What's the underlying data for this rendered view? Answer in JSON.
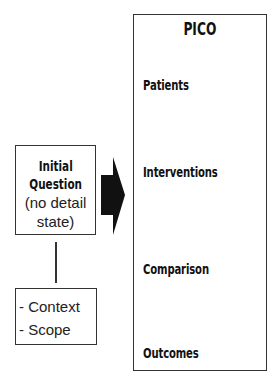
{
  "pico": {
    "title": "PICO",
    "items": [
      "Patients",
      "Interventions",
      "Comparison",
      "Outcomes"
    ]
  },
  "initial_question": {
    "title_line1": "Initial",
    "title_line2": "Question",
    "sub_line1": "(no detail",
    "sub_line2": "state)"
  },
  "scope_box": {
    "items": [
      "- Context",
      "- Scope"
    ]
  },
  "arrow": {
    "icon": "right-arrow-icon",
    "color": "#111111"
  }
}
